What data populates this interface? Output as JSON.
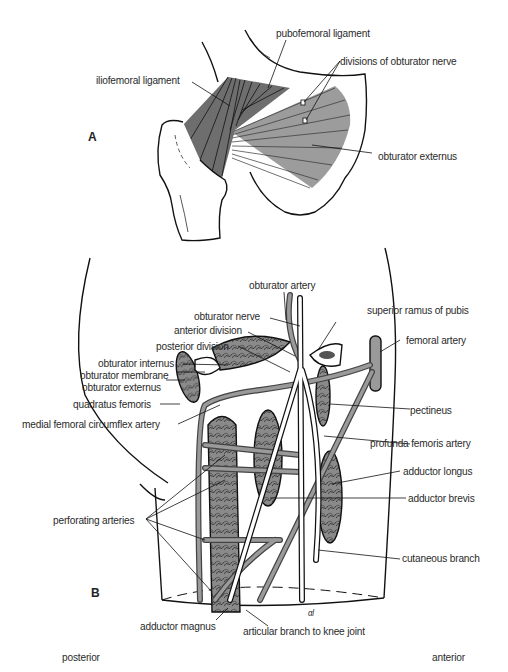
{
  "figure_a": {
    "panel_label": "A",
    "labels": {
      "pubofemoral": "pubofemoral ligament",
      "obturator_nerve_divisions": "divisions of obturator nerve",
      "iliofemoral": "iliofemoral ligament",
      "obturator_externus": "obturator externus"
    }
  },
  "figure_b": {
    "panel_label": "B",
    "labels": {
      "obturator_artery": "obturator artery",
      "obturator_nerve": "obturator nerve",
      "superior_ramus": "superior ramus of pubis",
      "anterior_division": "anterior division",
      "posterior_division": "posterior division",
      "femoral_artery": "femoral artery",
      "obturator_internus": "obturator internus",
      "obturator_membrane": "obturator membrane",
      "obturator_externus": "obturator externus",
      "quadratus_femoris": "quadratus femoris",
      "pectineus": "pectineus",
      "medial_femoral_circumflex": "medial femoral circumflex  artery",
      "profunda_femoris": "profunda femoris artery",
      "adductor_longus": "adductor longus",
      "adductor_brevis": "adductor brevis",
      "perforating_arteries": "perforating arteries",
      "cutaneous_branch": "cutaneous branch",
      "adductor_magnus": "adductor magnus",
      "articular_branch": "articular branch to knee  joint"
    },
    "signature": "αl"
  },
  "orientation": {
    "left": "posterior",
    "right": "anterior"
  }
}
